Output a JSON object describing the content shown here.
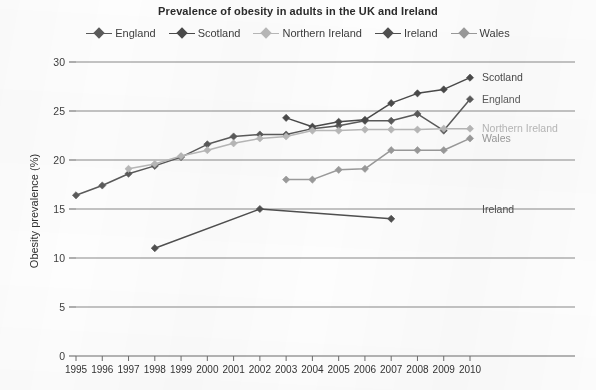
{
  "chart_data": {
    "type": "line",
    "title": "Prevalence of obesity in adults in the UK and Ireland",
    "xlabel": "",
    "ylabel": "Obesity prevalence (%)",
    "xlim": [
      1995,
      2010
    ],
    "ylim": [
      0,
      30
    ],
    "ytick_labels": [
      "0",
      "5",
      "10",
      "15",
      "20",
      "25",
      "30"
    ],
    "yticks": [
      0,
      5,
      10,
      15,
      20,
      25,
      30
    ],
    "grid": "horizontal",
    "legend_position": "top-center",
    "x": [
      1995,
      1996,
      1997,
      1998,
      1999,
      2000,
      2001,
      2002,
      2003,
      2004,
      2005,
      2006,
      2007,
      2008,
      2009,
      2010
    ],
    "xtick_labels": [
      "1995",
      "1996",
      "1997",
      "1998",
      "1999",
      "2000",
      "2001",
      "2002",
      "2003",
      "2004",
      "2005",
      "2006",
      "2007",
      "2008",
      "2009",
      "2010"
    ],
    "series": [
      {
        "name": "England",
        "color": "#5a5a5a",
        "end_label": "England",
        "points": [
          {
            "x": 1995,
            "y": 16.4
          },
          {
            "x": 1996,
            "y": 17.4
          },
          {
            "x": 1997,
            "y": 18.6
          },
          {
            "x": 1998,
            "y": 19.4
          },
          {
            "x": 1999,
            "y": 20.3
          },
          {
            "x": 2000,
            "y": 21.6
          },
          {
            "x": 2001,
            "y": 22.4
          },
          {
            "x": 2002,
            "y": 22.6
          },
          {
            "x": 2003,
            "y": 22.6
          },
          {
            "x": 2004,
            "y": 23.2
          },
          {
            "x": 2005,
            "y": 23.5
          },
          {
            "x": 2006,
            "y": 24.0
          },
          {
            "x": 2007,
            "y": 24.0
          },
          {
            "x": 2008,
            "y": 24.7
          },
          {
            "x": 2009,
            "y": 23.0
          },
          {
            "x": 2010,
            "y": 26.2
          }
        ]
      },
      {
        "name": "Scotland",
        "color": "#4a4a4a",
        "end_label": "Scotland",
        "points": [
          {
            "x": 2003,
            "y": 24.3
          },
          {
            "x": 2004,
            "y": 23.4
          },
          {
            "x": 2005,
            "y": 23.9
          },
          {
            "x": 2006,
            "y": 24.1
          },
          {
            "x": 2007,
            "y": 25.8
          },
          {
            "x": 2008,
            "y": 26.8
          },
          {
            "x": 2009,
            "y": 27.2
          },
          {
            "x": 2010,
            "y": 28.4
          }
        ]
      },
      {
        "name": "Northern Ireland",
        "color": "#b8b8b8",
        "end_label": "Northern Ireland",
        "points": [
          {
            "x": 1997,
            "y": 19.1
          },
          {
            "x": 1998,
            "y": 19.6
          },
          {
            "x": 1999,
            "y": 20.4
          },
          {
            "x": 2000,
            "y": 21.0
          },
          {
            "x": 2001,
            "y": 21.7
          },
          {
            "x": 2002,
            "y": 22.2
          },
          {
            "x": 2003,
            "y": 22.4
          },
          {
            "x": 2004,
            "y": 23.0
          },
          {
            "x": 2005,
            "y": 23.0
          },
          {
            "x": 2006,
            "y": 23.1
          },
          {
            "x": 2007,
            "y": 23.1
          },
          {
            "x": 2008,
            "y": 23.1
          },
          {
            "x": 2009,
            "y": 23.2
          },
          {
            "x": 2010,
            "y": 23.2
          }
        ]
      },
      {
        "name": "Ireland",
        "color": "#4f4f4f",
        "end_label": "Ireland",
        "points": [
          {
            "x": 1998,
            "y": 11.0
          },
          {
            "x": 2002,
            "y": 15.0
          },
          {
            "x": 2007,
            "y": 14.0
          }
        ]
      },
      {
        "name": "Wales",
        "color": "#9a9a9a",
        "end_label": "Wales",
        "points": [
          {
            "x": 2003,
            "y": 18.0
          },
          {
            "x": 2004,
            "y": 18.0
          },
          {
            "x": 2005,
            "y": 19.0
          },
          {
            "x": 2006,
            "y": 19.1
          },
          {
            "x": 2007,
            "y": 21.0
          },
          {
            "x": 2008,
            "y": 21.0
          },
          {
            "x": 2009,
            "y": 21.0
          },
          {
            "x": 2010,
            "y": 22.2
          }
        ]
      }
    ]
  },
  "legend": {
    "items": [
      {
        "label": "England",
        "color": "#5a5a5a"
      },
      {
        "label": "Scotland",
        "color": "#4a4a4a"
      },
      {
        "label": "Northern Ireland",
        "color": "#b8b8b8"
      },
      {
        "label": "Ireland",
        "color": "#4f4f4f"
      },
      {
        "label": "Wales",
        "color": "#9a9a9a"
      }
    ]
  },
  "colors": {
    "background": "#fdfdfd",
    "gridline": "#8a8a8a",
    "axis": "#6d6d6d",
    "text": "#3a3a3a"
  }
}
